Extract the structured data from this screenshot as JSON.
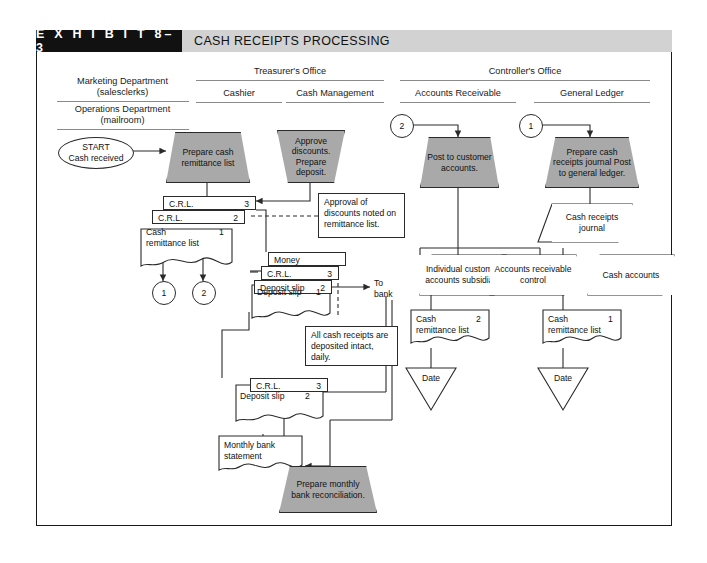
{
  "exhibit": {
    "number": "E X H I B I T   8–3",
    "title": "CASH RECEIPTS PROCESSING"
  },
  "columns": {
    "marketing": "Marketing Department\n(salesclerks)",
    "marketing_l1": "Marketing Department",
    "marketing_l2": "(salesclerks)",
    "operations_l1": "Operations Department",
    "operations_l2": "(mailroom)",
    "treasurer": "Treasurer's Office",
    "cashier": "Cashier",
    "cash_management": "Cash Management",
    "controller": "Controller's Office",
    "accounts_receivable": "Accounts Receivable",
    "general_ledger": "General Ledger"
  },
  "nodes": {
    "start": {
      "line1": "START",
      "line2": "Cash received"
    },
    "prepare_crl": "Prepare cash remittance list",
    "approve_discounts": "Approve discounts. Prepare deposit.",
    "post_customer": "Post to customer accounts.",
    "prepare_journal": "Prepare cash receipts journal Post to general ledger.",
    "prepare_recon": "Prepare monthly bank reconciliation.",
    "note_approval": "Approval of discounts noted on remittance list.",
    "note_intact": "All cash receipts are deposited intact, daily.",
    "to_bank_l1": "To",
    "to_bank_l2": "bank"
  },
  "documents": {
    "crl3_a": {
      "label": "C.R.L.",
      "copy": "3"
    },
    "crl2_a": {
      "label": "C.R.L.",
      "copy": "2"
    },
    "crl1_a": {
      "label": "Cash remittance list",
      "copy": "1"
    },
    "money": {
      "label": "Money",
      "copy": ""
    },
    "crl3_b": {
      "label": "C.R.L.",
      "copy": "3"
    },
    "deposit2_a": {
      "label": "Deposit slip",
      "copy": "2"
    },
    "deposit1_a": {
      "label": "Deposit slip",
      "copy": "1"
    },
    "crl3_c": {
      "label": "C.R.L.",
      "copy": "3"
    },
    "deposit2_b": {
      "label": "Deposit slip",
      "copy": "2"
    },
    "bank_stmt": {
      "label": "Monthly bank statement",
      "copy": ""
    },
    "crl2_ar": {
      "label": "Cash remittance list",
      "copy": "2"
    },
    "crl1_gl": {
      "label": "Cash remittance list",
      "copy": "1"
    },
    "cash_receipts_journal": {
      "label": "Cash receipts journal"
    },
    "individual_customer": {
      "label": "Individual customer accounts subsidiary"
    },
    "ar_control": {
      "label": "Accounts receivable control"
    },
    "cash_accounts": {
      "label": "Cash accounts"
    },
    "date_ar": {
      "label": "Date"
    },
    "date_gl": {
      "label": "Date"
    }
  },
  "connectors": {
    "c1_left": "1",
    "c2_left": "2",
    "c2_ar": "2",
    "c1_gl": "1"
  },
  "colors": {
    "process_fill": "#a9a9a9",
    "title_black": "#111111",
    "title_gray": "#d2d2d2",
    "stroke": "#2a2a2a"
  }
}
